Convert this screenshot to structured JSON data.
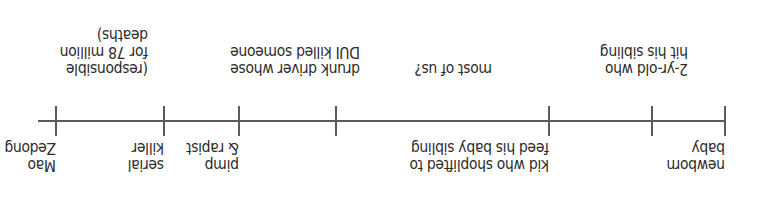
{
  "diagram": {
    "type": "moral-scale-number-line",
    "orientation": "rotated-180",
    "ticks": [
      {
        "id": "newborn",
        "x": 33
      },
      {
        "id": "two-yr-old",
        "x": 106
      },
      {
        "id": "kid-shoplifter",
        "x": 209
      },
      {
        "id": "most-of-us",
        "x": 422
      },
      {
        "id": "pimp-drunk",
        "x": 519
      },
      {
        "id": "serial-killer",
        "x": 594
      },
      {
        "id": "mao",
        "x": 702
      }
    ],
    "labels_above": {
      "newborn": "newborn\nbaby",
      "kid": "kid who shoplifted to\nfeed his baby sibling",
      "pimp": "pimp\n& rapist",
      "serial": "serial\nkiller",
      "mao": "Mao\nZedong"
    },
    "labels_below": {
      "two_yr_old": "2-yr-old who\nhit his sibling",
      "most_of_us": "most of us?",
      "drunk_driver": "drunk driver whose\nDUI killed someone",
      "responsible": "(responsible\nfor 78 million\ndeaths)"
    }
  }
}
